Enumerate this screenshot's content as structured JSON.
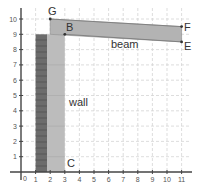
{
  "diagram": {
    "axes": {
      "x_ticks": [
        "1",
        "2",
        "3",
        "4",
        "5",
        "6",
        "7",
        "8",
        "9",
        "10",
        "11"
      ],
      "y_ticks": [
        "1",
        "2",
        "3",
        "4",
        "5",
        "6",
        "7",
        "8",
        "9",
        "10"
      ],
      "origin_label": "0",
      "xlim": [
        0,
        11.5
      ],
      "ylim": [
        0,
        10.8
      ],
      "grid": true
    },
    "points": {
      "G": {
        "label": "G",
        "x": 2,
        "y": 10
      },
      "B": {
        "label": "B",
        "x": 3,
        "y": 9
      },
      "F": {
        "label": "F",
        "x": 11,
        "y": 9.5
      },
      "E": {
        "label": "E",
        "x": 11,
        "y": 8.5
      },
      "C": {
        "label": "C",
        "x": 3,
        "y": 0
      }
    },
    "labels": {
      "beam": "beam",
      "wall": "wall"
    },
    "colors": {
      "beam_fill": "#b5b5b5",
      "wall_dark": "#6e6e6e",
      "wall_light": "#b9b9b9",
      "grid": "#d0d0d0",
      "axis": "#444444"
    }
  }
}
